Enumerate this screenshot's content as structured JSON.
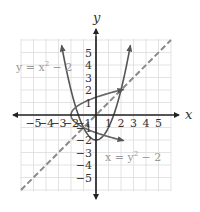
{
  "chart_data": {
    "type": "line",
    "title": "",
    "xlabel": "x",
    "ylabel": "y",
    "xlim": [
      -6,
      6
    ],
    "ylim": [
      -6,
      6
    ],
    "grid": true,
    "x_tick_labels": [
      "-5",
      "-4",
      "-3",
      "-2",
      "-1",
      "1",
      "2",
      "3",
      "4",
      "5"
    ],
    "y_tick_labels": [
      "5",
      "4",
      "3",
      "2",
      "1",
      "-1",
      "-2",
      "-3",
      "-4",
      "-5"
    ],
    "series": [
      {
        "name": "y = x^2 - 2",
        "style": "solid",
        "color": "#555555",
        "description": "upward parabola, vertex (0,-2)"
      },
      {
        "name": "x = y^2 - 2",
        "style": "solid",
        "color": "#666666",
        "description": "rightward parabola, vertex (-2,0)"
      },
      {
        "name": "y = x",
        "style": "dashed",
        "color": "#8a8a8a",
        "description": "line of symmetry"
      }
    ],
    "annotations": [
      {
        "text": "y = x² − 2",
        "near": [
          -4.5,
          3.8
        ]
      },
      {
        "text": "x = y² − 2",
        "near": [
          2.3,
          -3.3
        ]
      }
    ],
    "intersections": [
      [
        -1,
        -1
      ],
      [
        2,
        2
      ]
    ]
  },
  "labels": {
    "x_axis": "x",
    "y_axis": "y",
    "eq1_base": "y = x",
    "eq1_exp": "2",
    "eq1_tail": " − 2",
    "eq2_base": "x = y",
    "eq2_exp": "2",
    "eq2_tail": " − 2"
  },
  "ticks": {
    "x": [
      {
        "v": -5,
        "t": "−5"
      },
      {
        "v": -4,
        "t": "−4"
      },
      {
        "v": -3,
        "t": "−3"
      },
      {
        "v": -2,
        "t": "−2"
      },
      {
        "v": -1,
        "t": "−1"
      },
      {
        "v": 1,
        "t": "1"
      },
      {
        "v": 2,
        "t": "2"
      },
      {
        "v": 3,
        "t": "3"
      },
      {
        "v": 4,
        "t": "4"
      },
      {
        "v": 5,
        "t": "5"
      }
    ],
    "y": [
      {
        "v": 5,
        "t": "5"
      },
      {
        "v": 4,
        "t": "4"
      },
      {
        "v": 3,
        "t": "3"
      },
      {
        "v": 2,
        "t": "2"
      },
      {
        "v": 1,
        "t": "1"
      },
      {
        "v": -1,
        "t": "−1"
      },
      {
        "v": -2,
        "t": "−2"
      },
      {
        "v": -3,
        "t": "−3"
      },
      {
        "v": -4,
        "t": "−4"
      },
      {
        "v": -5,
        "t": "−5"
      }
    ]
  },
  "colors": {
    "grid": "#dcdcdc",
    "axis": "#222222",
    "curve": "#555555",
    "dashed": "#8a8a8a",
    "equation_text": "#9a9a9a"
  }
}
